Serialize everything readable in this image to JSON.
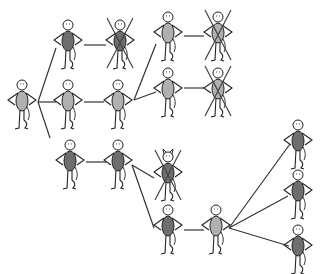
{
  "diagram": {
    "type": "tree",
    "colors": {
      "background": "#ffffff",
      "line": "#333333",
      "body_light": "#b0b0b0",
      "body_dark": "#6e6e6e",
      "cross": "#444444"
    },
    "nodes": [
      {
        "id": "root",
        "x": 22,
        "y": 80,
        "body": "light",
        "crossed": false,
        "horns": false
      },
      {
        "id": "a1",
        "x": 68,
        "y": 20,
        "body": "dark",
        "crossed": false,
        "horns": false
      },
      {
        "id": "a2",
        "x": 68,
        "y": 80,
        "body": "light",
        "crossed": false,
        "horns": false
      },
      {
        "id": "a3",
        "x": 70,
        "y": 140,
        "body": "dark",
        "crossed": false,
        "horns": false
      },
      {
        "id": "b1",
        "x": 120,
        "y": 20,
        "body": "dark",
        "crossed": true,
        "horns": false
      },
      {
        "id": "b2",
        "x": 118,
        "y": 80,
        "body": "light",
        "crossed": false,
        "horns": false
      },
      {
        "id": "b3",
        "x": 118,
        "y": 140,
        "body": "dark",
        "crossed": false,
        "horns": false
      },
      {
        "id": "c1",
        "x": 168,
        "y": 12,
        "body": "light",
        "crossed": false,
        "horns": false
      },
      {
        "id": "c2",
        "x": 168,
        "y": 68,
        "body": "light",
        "crossed": false,
        "horns": false
      },
      {
        "id": "c3",
        "x": 168,
        "y": 152,
        "body": "dark",
        "crossed": true,
        "horns": true
      },
      {
        "id": "c4",
        "x": 168,
        "y": 205,
        "body": "dark",
        "crossed": false,
        "horns": false
      },
      {
        "id": "d1",
        "x": 218,
        "y": 12,
        "body": "light",
        "crossed": true,
        "horns": false
      },
      {
        "id": "d2",
        "x": 218,
        "y": 68,
        "body": "light",
        "crossed": true,
        "horns": false
      },
      {
        "id": "d3",
        "x": 216,
        "y": 205,
        "body": "light",
        "crossed": false,
        "horns": false
      },
      {
        "id": "e1",
        "x": 298,
        "y": 120,
        "body": "dark",
        "crossed": false,
        "horns": false
      },
      {
        "id": "e2",
        "x": 298,
        "y": 170,
        "body": "dark",
        "crossed": false,
        "horns": false
      },
      {
        "id": "e3",
        "x": 298,
        "y": 225,
        "body": "dark",
        "crossed": false,
        "horns": false
      }
    ],
    "edges": [
      {
        "x1": 38,
        "y1": 102,
        "x2": 56,
        "y2": 48
      },
      {
        "x1": 38,
        "y1": 102,
        "x2": 56,
        "y2": 102
      },
      {
        "x1": 38,
        "y1": 102,
        "x2": 50,
        "y2": 138
      },
      {
        "x1": 84,
        "y1": 45,
        "x2": 106,
        "y2": 45
      },
      {
        "x1": 84,
        "y1": 102,
        "x2": 104,
        "y2": 102
      },
      {
        "x1": 86,
        "y1": 162,
        "x2": 106,
        "y2": 162
      },
      {
        "x1": 134,
        "y1": 100,
        "x2": 156,
        "y2": 44
      },
      {
        "x1": 134,
        "y1": 100,
        "x2": 156,
        "y2": 92
      },
      {
        "x1": 132,
        "y1": 165,
        "x2": 154,
        "y2": 178
      },
      {
        "x1": 132,
        "y1": 165,
        "x2": 154,
        "y2": 228
      },
      {
        "x1": 184,
        "y1": 36,
        "x2": 204,
        "y2": 36
      },
      {
        "x1": 184,
        "y1": 88,
        "x2": 204,
        "y2": 88
      },
      {
        "x1": 184,
        "y1": 230,
        "x2": 204,
        "y2": 230
      },
      {
        "x1": 229,
        "y1": 228,
        "x2": 290,
        "y2": 144
      },
      {
        "x1": 229,
        "y1": 228,
        "x2": 288,
        "y2": 196
      },
      {
        "x1": 229,
        "y1": 228,
        "x2": 289,
        "y2": 246
      }
    ]
  }
}
